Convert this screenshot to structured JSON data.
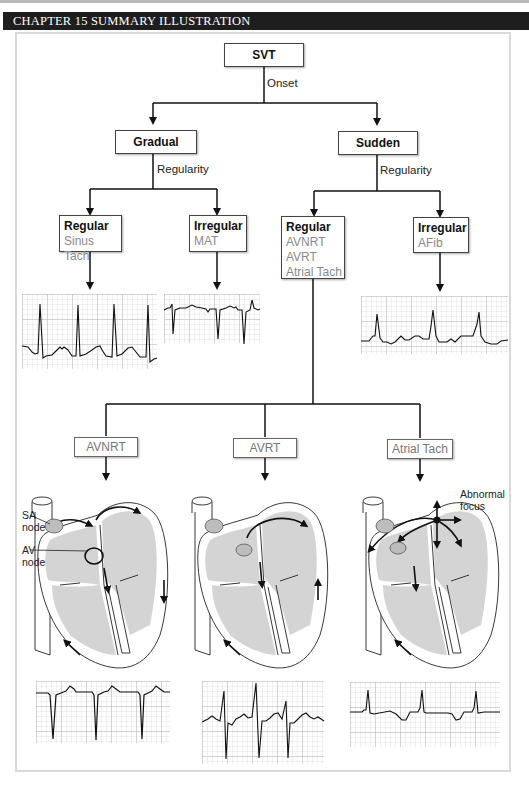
{
  "header": {
    "title": "CHAPTER 15 SUMMARY ILLUSTRATION"
  },
  "root": {
    "label": "SVT",
    "edge_label": "Onset"
  },
  "onset": {
    "gradual": {
      "label": "Gradual",
      "edge_label": "Regularity"
    },
    "sudden": {
      "label": "Sudden",
      "edge_label": "Regularity"
    }
  },
  "gradual_branches": [
    {
      "title": "Regular",
      "items": [
        "Sinus Tach"
      ]
    },
    {
      "title": "Irregular",
      "items": [
        "MAT"
      ]
    }
  ],
  "sudden_branches": [
    {
      "title": "Regular",
      "items": [
        "AVNRT",
        "AVRT",
        "Atrial Tach"
      ]
    },
    {
      "title": "Irregular",
      "items": [
        "AFib"
      ]
    }
  ],
  "mechanisms": [
    {
      "label": "AVNRT",
      "callouts": [
        "SA node",
        "AV node"
      ]
    },
    {
      "label": "AVRT",
      "callouts": []
    },
    {
      "label": "Atrial Tach",
      "callouts": [
        "Abnormal focus"
      ]
    }
  ],
  "callouts": {
    "sa_node": [
      "SA",
      "node"
    ],
    "av_node": [
      "AV",
      "node"
    ],
    "abnormal_focus": [
      "Abnormal",
      "focus"
    ]
  },
  "ecg_strips": [
    {
      "name": "Sinus Tach",
      "pattern": "tall narrow upright QRS, regular"
    },
    {
      "name": "MAT",
      "pattern": "negative QRS, irregular, varying P waves"
    },
    {
      "name": "AFib",
      "pattern": "irregular upright QRS, fibrillatory baseline"
    },
    {
      "name": "AVNRT",
      "pattern": "deep negative QRS, regular"
    },
    {
      "name": "AVRT",
      "pattern": "biphasic QRS, regular"
    },
    {
      "name": "Atrial Tach",
      "pattern": "small upright QRS, inverted P waves"
    }
  ],
  "colors": {
    "header_bg": "#1e1e1e",
    "heart_fill": "#d4d4d4",
    "grid": "#c8c8c8",
    "sub_text": "#8a8a8a"
  }
}
